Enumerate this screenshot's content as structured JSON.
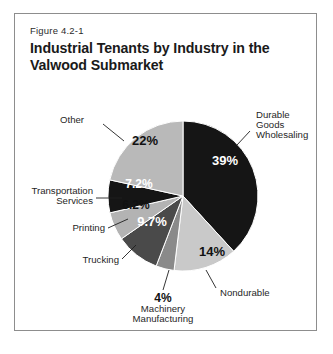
{
  "figure": {
    "number": "Figure 4.2-1",
    "title": "Industrial Tenants by Industry in the Valwood Submarket"
  },
  "chart_data": {
    "type": "pie",
    "title": "Industrial Tenants by Industry in the Valwood Submarket",
    "subtitle": "Figure 4.2-1",
    "xlabel": "",
    "ylabel": "",
    "unit": "%",
    "legend_position": "none",
    "grid": false,
    "labels_inside_slices": true,
    "start_angle_deg": 0,
    "direction": "clockwise",
    "categories": [
      "Durable Goods Wholesaling",
      "Nondurable",
      "Machinery Manufacturing",
      "Trucking",
      "Printing",
      "Transportation Services",
      "Other"
    ],
    "values": [
      39,
      14,
      4,
      9.7,
      6.2,
      7.2,
      22
    ],
    "value_labels": [
      "39%",
      "14%",
      "4%",
      "9.7%",
      "6.2%",
      "7.2%",
      "22%"
    ],
    "slices": [
      {
        "name": "Durable Goods Wholesaling",
        "label": "Durable Goods Wholesaling",
        "label_lines": [
          "Durable",
          "Goods",
          "Wholesaling"
        ],
        "value": 39,
        "value_label": "39%",
        "color": "#151515",
        "text_color": "#ffffff"
      },
      {
        "name": "Nondurable",
        "label": "Nondurable",
        "label_lines": [
          "Nondurable"
        ],
        "value": 14,
        "value_label": "14%",
        "color": "#c9c9c9",
        "text_color": "#111111"
      },
      {
        "name": "Machinery Manufacturing",
        "label": "Machinery Manufacturing",
        "label_lines": [
          "4%",
          "Machinery",
          "Manufacturing"
        ],
        "value": 4,
        "value_label": "4%",
        "color": "#8a8a8a",
        "text_color": "#111111"
      },
      {
        "name": "Trucking",
        "label": "Trucking",
        "label_lines": [
          "Trucking"
        ],
        "value": 9.7,
        "value_label": "9.7%",
        "color": "#4a4a4a",
        "text_color": "#ffffff"
      },
      {
        "name": "Printing",
        "label": "Printing",
        "label_lines": [
          "Printing"
        ],
        "value": 6.2,
        "value_label": "6.2%",
        "color": "#b3b3b3",
        "text_color": "#111111"
      },
      {
        "name": "Transportation Services",
        "label": "Transportation Services",
        "label_lines": [
          "Transportation",
          "Services"
        ],
        "value": 7.2,
        "value_label": "7.2%",
        "color": "#151515",
        "text_color": "#ffffff"
      },
      {
        "name": "Other",
        "label": "Other",
        "label_lines": [
          "Other"
        ],
        "value": 22,
        "value_label": "22%",
        "color": "#b9b9b9",
        "text_color": "#111111"
      }
    ],
    "colors": {
      "black": "#151515",
      "dark_gray": "#4a4a4a",
      "mid_gray": "#8a8a8a",
      "light_gray": "#c9c9c9",
      "pale_gray": "#b9b9b9",
      "printing_gray": "#b3b3b3",
      "frame": "#8d8d8d",
      "background": "#ffffff",
      "text": "#1a1a1a"
    }
  },
  "labels": {
    "durable_l1": "Durable",
    "durable_l2": "Goods",
    "durable_l3": "Wholesaling",
    "durable_value": "39%",
    "nondurable": "Nondurable",
    "nondurable_value": "14%",
    "machinery_value": "4%",
    "machinery_l1": "Machinery",
    "machinery_l2": "Manufacturing",
    "trucking": "Trucking",
    "trucking_value": "9.7%",
    "printing": "Printing",
    "printing_value": "6.2%",
    "transport_l1": "Transportation",
    "transport_l2": "Services",
    "transport_value": "7.2%",
    "other": "Other",
    "other_value": "22%"
  }
}
